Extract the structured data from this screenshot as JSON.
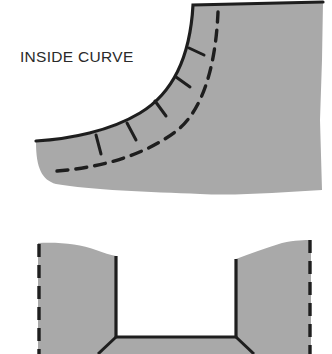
{
  "diagram": {
    "labels": {
      "inside_curve": "INSIDE CURVE"
    },
    "colors": {
      "fabric_fill": "#a9a9a9",
      "line": "#1e1e1e",
      "background": "#ffffff",
      "text": "#2a2a2a"
    },
    "figures": [
      {
        "id": "inside-curve-figure",
        "description": "Fabric piece with concave curved seam edge, clip marks and dashed stitching line"
      },
      {
        "id": "corner-figure",
        "description": "Fabric piece with rectangular notch, dashed side edges and diagonal corner lines"
      }
    ]
  }
}
